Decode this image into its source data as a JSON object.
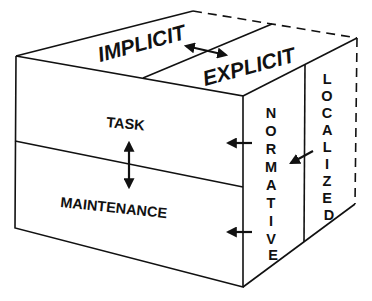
{
  "diagram": {
    "type": "3d-cube-taxonomy",
    "colors": {
      "line": "#111111",
      "background": "#ffffff"
    },
    "top_face": {
      "labels": [
        "IMPLICIT",
        "EXPLICIT"
      ],
      "relation": "double-arrow"
    },
    "front_face": {
      "labels": [
        "TASK",
        "MAINTENANCE"
      ],
      "relation": "double-arrow"
    },
    "right_face": {
      "labels": [
        "NORMATIVE",
        "LOCALIZED"
      ],
      "arrows": [
        "arrow-to-task",
        "arrow-to-maintenance",
        "localized-to-normative"
      ]
    }
  }
}
